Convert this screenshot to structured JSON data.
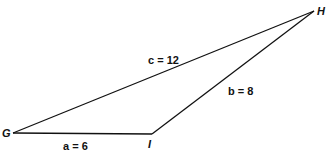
{
  "diagram": {
    "type": "triangle",
    "vertices": [
      {
        "name": "G",
        "x": 13,
        "y": 133
      },
      {
        "name": "I",
        "x": 152,
        "y": 134
      },
      {
        "name": "H",
        "x": 314,
        "y": 11
      }
    ],
    "sides": [
      {
        "name": "a",
        "label": "a = 6",
        "from": "G",
        "to": "I"
      },
      {
        "name": "b",
        "label": "b = 8",
        "from": "I",
        "to": "H"
      },
      {
        "name": "c",
        "label": "c = 12",
        "from": "G",
        "to": "H"
      }
    ]
  }
}
